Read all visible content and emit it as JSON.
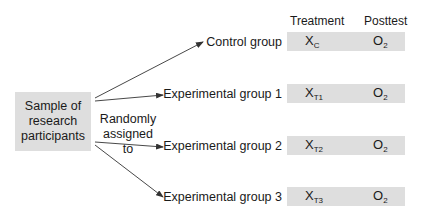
{
  "source": {
    "label_line1": "Sample of",
    "label_line2": "research",
    "label_line3": "participants"
  },
  "assignment": {
    "line1": "Randomly",
    "line2": "assigned to"
  },
  "headers": {
    "treatment": "Treatment",
    "posttest": "Posttest"
  },
  "groups": [
    {
      "label": "Control group",
      "treatment": "X",
      "treatment_sub": "C",
      "posttest": "O",
      "posttest_sub": "2"
    },
    {
      "label": "Experimental group 1",
      "treatment": "X",
      "treatment_sub": "T1",
      "posttest": "O",
      "posttest_sub": "2"
    },
    {
      "label": "Experimental group 2",
      "treatment": "X",
      "treatment_sub": "T2",
      "posttest": "O",
      "posttest_sub": "2"
    },
    {
      "label": "Experimental group 3",
      "treatment": "X",
      "treatment_sub": "T3",
      "posttest": "O",
      "posttest_sub": "2"
    }
  ],
  "colors": {
    "box_fill": "#dedede",
    "arrow": "#333333",
    "text": "#1a1a1a"
  }
}
